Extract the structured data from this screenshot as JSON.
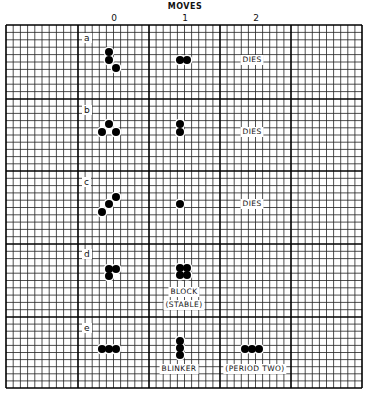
{
  "title": "MOVES",
  "columns": [
    {
      "label": "0",
      "x": 114
    },
    {
      "label": "1",
      "x": 185
    },
    {
      "label": "2",
      "x": 256
    }
  ],
  "grid": {
    "left": 6,
    "top": 25,
    "right": 362,
    "bottom": 388,
    "cell": 7.12,
    "major_x": [
      6,
      78,
      149,
      220,
      291,
      362
    ],
    "major_y": [
      25,
      99,
      171,
      244,
      317,
      388
    ],
    "line_color": "#222222"
  },
  "rows": [
    {
      "id": "a",
      "label": "a",
      "label_pos": [
        82,
        33
      ],
      "cells": [
        [
          109,
          52
        ],
        [
          109,
          60
        ],
        [
          116,
          68
        ],
        [
          180,
          60
        ],
        [
          187,
          60
        ]
      ],
      "notes": [
        {
          "text": "DIES",
          "x": 252,
          "y": 55
        }
      ]
    },
    {
      "id": "b",
      "label": "b",
      "label_pos": [
        82,
        105
      ],
      "cells": [
        [
          109,
          124
        ],
        [
          102,
          132
        ],
        [
          116,
          132
        ],
        [
          180,
          124
        ],
        [
          180,
          132
        ]
      ],
      "notes": [
        {
          "text": "DIES",
          "x": 252,
          "y": 127
        }
      ]
    },
    {
      "id": "c",
      "label": "c",
      "label_pos": [
        82,
        177
      ],
      "cells": [
        [
          116,
          197
        ],
        [
          109,
          204
        ],
        [
          102,
          212
        ],
        [
          180,
          204
        ]
      ],
      "notes": [
        {
          "text": "DIES",
          "x": 252,
          "y": 199
        }
      ]
    },
    {
      "id": "d",
      "label": "d",
      "label_pos": [
        82,
        249
      ],
      "cells": [
        [
          109,
          269
        ],
        [
          116,
          269
        ],
        [
          109,
          276
        ],
        [
          180,
          268
        ],
        [
          187,
          268
        ],
        [
          180,
          275
        ],
        [
          187,
          275
        ]
      ],
      "notes": [
        {
          "text": "BLOCK",
          "x": 184,
          "y": 287
        },
        {
          "text": "(STABLE)",
          "x": 184,
          "y": 300
        }
      ]
    },
    {
      "id": "e",
      "label": "e",
      "label_pos": [
        82,
        323
      ],
      "cells": [
        [
          102,
          349
        ],
        [
          109,
          349
        ],
        [
          116,
          349
        ],
        [
          180,
          341
        ],
        [
          180,
          348
        ],
        [
          180,
          355
        ],
        [
          245,
          349
        ],
        [
          252,
          349
        ],
        [
          259,
          349
        ]
      ],
      "notes": [
        {
          "text": "BLINKER",
          "x": 179,
          "y": 364
        },
        {
          "text": "(PERIOD TWO)",
          "x": 255,
          "y": 364
        }
      ]
    }
  ]
}
